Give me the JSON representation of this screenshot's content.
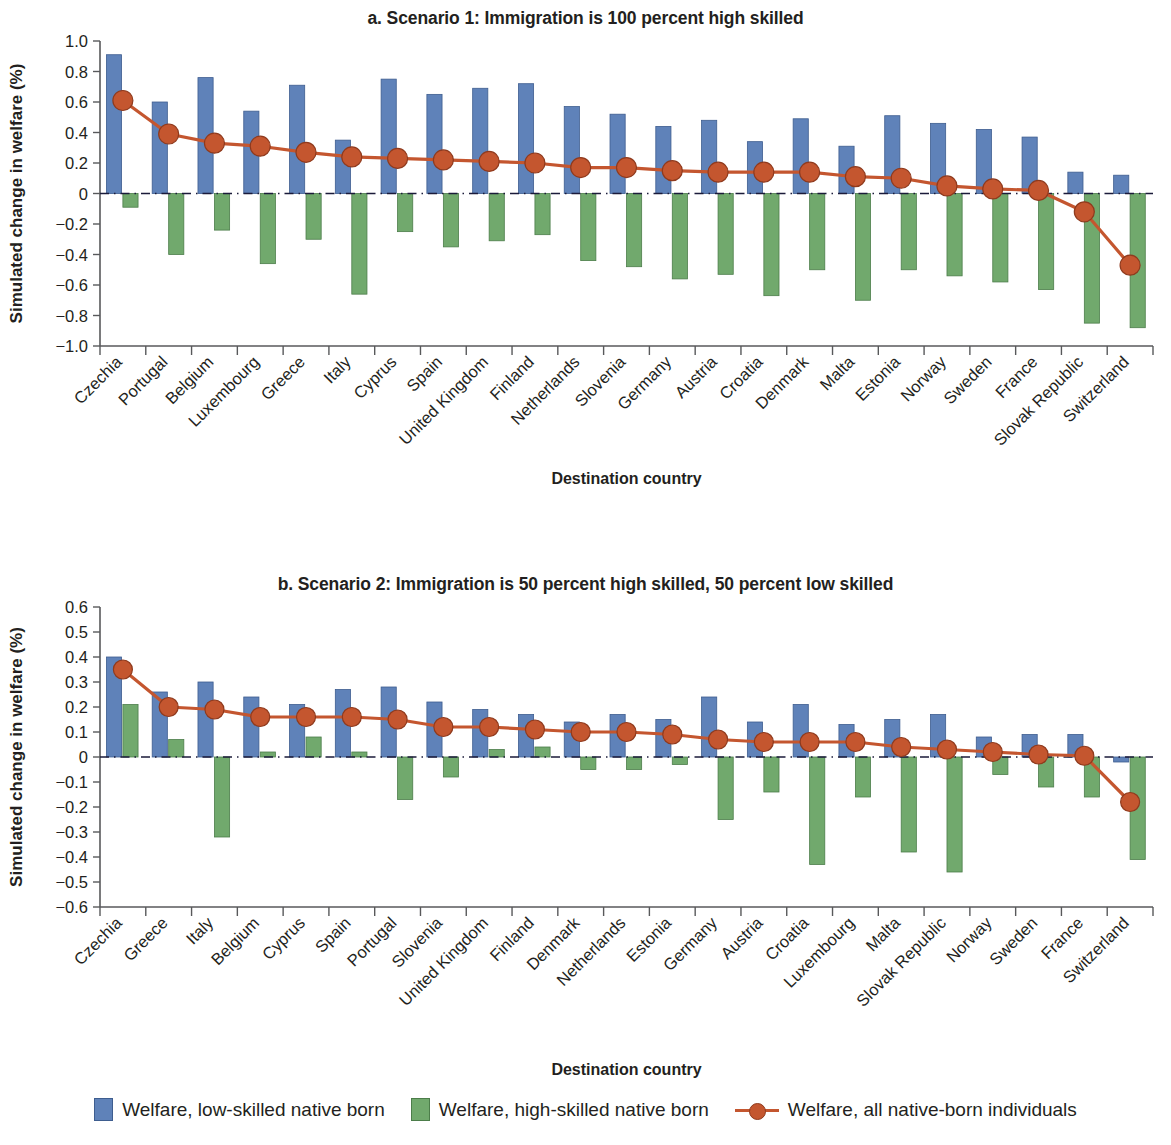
{
  "figure": {
    "legend": [
      {
        "key": "low_skilled",
        "label": "Welfare, low-skilled native born",
        "color": "#5f82b9",
        "marker": "square"
      },
      {
        "key": "high_skilled",
        "label": "Welfare, high-skilled native born",
        "color": "#71a96d",
        "marker": "square"
      },
      {
        "key": "all_native",
        "label": "Welfare, all native-born individuals",
        "color": "#c4562f",
        "marker": "line-circle"
      }
    ]
  },
  "chart_data": [
    {
      "type": "bar",
      "panel": "a",
      "title": "a. Scenario 1: Immigration is 100 percent high skilled",
      "xlabel": "Destination country",
      "ylabel": "Simulated change in welfare (%)",
      "ylim": [
        -1.0,
        1.0
      ],
      "yticks": [
        "1.0",
        "0.8",
        "0.6",
        "0.4",
        "0.2",
        "0",
        "−0.2",
        "−0.4",
        "−0.6",
        "−0.8",
        "−1.0"
      ],
      "ytick_values": [
        1.0,
        0.8,
        0.6,
        0.4,
        0.2,
        0,
        -0.2,
        -0.4,
        -0.6,
        -0.8,
        -1.0
      ],
      "grid": false,
      "zero_line": true,
      "legend_position": "bottom",
      "categories": [
        "Czechia",
        "Portugal",
        "Belgium",
        "Luxembourg",
        "Greece",
        "Italy",
        "Cyprus",
        "Spain",
        "United Kingdom",
        "Finland",
        "Netherlands",
        "Slovenia",
        "Germany",
        "Austria",
        "Croatia",
        "Denmark",
        "Malta",
        "Estonia",
        "Norway",
        "Sweden",
        "France",
        "Slovak Republic",
        "Switzerland"
      ],
      "series": [
        {
          "name": "Welfare, low-skilled native born",
          "type": "bar",
          "color": "#5f82b9",
          "values": [
            0.91,
            0.6,
            0.76,
            0.54,
            0.71,
            0.35,
            0.75,
            0.65,
            0.69,
            0.72,
            0.57,
            0.52,
            0.44,
            0.48,
            0.34,
            0.49,
            0.31,
            0.51,
            0.46,
            0.42,
            0.37,
            0.14,
            0.12
          ]
        },
        {
          "name": "Welfare, high-skilled native born",
          "type": "bar",
          "color": "#71a96d",
          "values": [
            -0.09,
            -0.4,
            -0.24,
            -0.46,
            -0.3,
            -0.66,
            -0.25,
            -0.35,
            -0.31,
            -0.27,
            -0.44,
            -0.48,
            -0.56,
            -0.53,
            -0.67,
            -0.5,
            -0.7,
            -0.5,
            -0.54,
            -0.58,
            -0.63,
            -0.85,
            -0.88
          ]
        },
        {
          "name": "Welfare, all native-born individuals",
          "type": "line",
          "color": "#c4562f",
          "values": [
            0.61,
            0.39,
            0.33,
            0.31,
            0.27,
            0.24,
            0.23,
            0.22,
            0.21,
            0.2,
            0.17,
            0.17,
            0.15,
            0.14,
            0.14,
            0.14,
            0.11,
            0.1,
            0.05,
            0.03,
            0.02,
            -0.12,
            -0.47
          ]
        }
      ]
    },
    {
      "type": "bar",
      "panel": "b",
      "title": "b. Scenario 2: Immigration is 50 percent high skilled, 50 percent low skilled",
      "xlabel": "Destination country",
      "ylabel": "Simulated change in welfare (%)",
      "ylim": [
        -0.6,
        0.6
      ],
      "yticks": [
        "0.6",
        "0.5",
        "0.4",
        "0.3",
        "0.2",
        "0.1",
        "0",
        "−0.1",
        "−0.2",
        "−0.3",
        "−0.4",
        "−0.5",
        "−0.6"
      ],
      "ytick_values": [
        0.6,
        0.5,
        0.4,
        0.3,
        0.2,
        0.1,
        0,
        -0.1,
        -0.2,
        -0.3,
        -0.4,
        -0.5,
        -0.6
      ],
      "grid": false,
      "zero_line": true,
      "legend_position": "bottom",
      "categories": [
        "Czechia",
        "Greece",
        "Italy",
        "Belgium",
        "Cyprus",
        "Spain",
        "Portugal",
        "Slovenia",
        "United Kingdom",
        "Finland",
        "Denmark",
        "Netherlands",
        "Estonia",
        "Germany",
        "Austria",
        "Croatia",
        "Luxembourg",
        "Malta",
        "Slovak Republic",
        "Norway",
        "Sweden",
        "France",
        "Switzerland"
      ],
      "series": [
        {
          "name": "Welfare, low-skilled native born",
          "type": "bar",
          "color": "#5f82b9",
          "values": [
            0.4,
            0.26,
            0.3,
            0.24,
            0.21,
            0.27,
            0.28,
            0.22,
            0.19,
            0.17,
            0.14,
            0.17,
            0.15,
            0.24,
            0.14,
            0.21,
            0.13,
            0.15,
            0.17,
            0.08,
            0.09,
            0.09,
            -0.02
          ]
        },
        {
          "name": "Welfare, high-skilled native born",
          "type": "bar",
          "color": "#71a96d",
          "values": [
            0.21,
            0.07,
            -0.32,
            0.02,
            0.08,
            0.02,
            -0.17,
            -0.08,
            0.03,
            0.04,
            -0.05,
            -0.05,
            -0.03,
            -0.25,
            -0.14,
            -0.43,
            -0.16,
            -0.38,
            -0.46,
            -0.07,
            -0.12,
            -0.16,
            -0.41
          ]
        },
        {
          "name": "Welfare, all native-born individuals",
          "type": "line",
          "color": "#c4562f",
          "values": [
            0.35,
            0.2,
            0.19,
            0.16,
            0.16,
            0.16,
            0.15,
            0.12,
            0.12,
            0.11,
            0.1,
            0.1,
            0.09,
            0.07,
            0.06,
            0.06,
            0.06,
            0.04,
            0.03,
            0.02,
            0.01,
            0.005,
            -0.18
          ]
        }
      ]
    }
  ]
}
